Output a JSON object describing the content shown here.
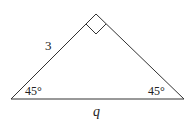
{
  "figure": {
    "type": "right isosceles triangle",
    "side_label_left": "3",
    "base_label": "q",
    "angle_left": "45°",
    "angle_right": "45°",
    "right_angle_marker": true,
    "line_color": "#333333",
    "vertices": {
      "apex": [
        96,
        14
      ],
      "bottom_left": [
        11,
        99
      ],
      "bottom_right": [
        184,
        99
      ]
    }
  }
}
